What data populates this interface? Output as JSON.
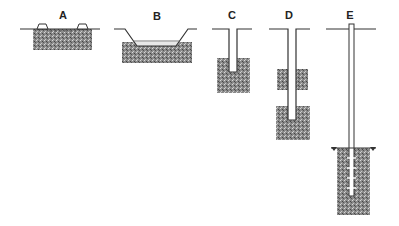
{
  "diagram": {
    "type": "well-types-cross-sections",
    "colors": {
      "line": "#333333",
      "stipple": "#6e6e6e",
      "background": "#ffffff"
    },
    "panels": [
      {
        "label": "A",
        "description": "surface spring / shallow pit with berms"
      },
      {
        "label": "B",
        "description": "excavated pond reaching aquifer"
      },
      {
        "label": "C",
        "description": "dug well into aquifer"
      },
      {
        "label": "D",
        "description": "deep well through two aquifer layers"
      },
      {
        "label": "E",
        "description": "tube well with screened pipe below water table"
      }
    ]
  }
}
